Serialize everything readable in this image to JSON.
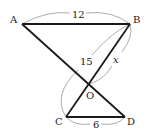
{
  "diagram": {
    "points": [
      {
        "name": "A",
        "x": 22,
        "y": 24,
        "label_x": 10,
        "label_y": 23
      },
      {
        "name": "B",
        "x": 130,
        "y": 24,
        "label_x": 133,
        "label_y": 23
      },
      {
        "name": "O",
        "x": 89,
        "y": 84,
        "label_x": 86,
        "label_y": 99
      },
      {
        "name": "C",
        "x": 66,
        "y": 117,
        "label_x": 55,
        "label_y": 125
      },
      {
        "name": "D",
        "x": 125,
        "y": 117,
        "label_x": 127,
        "label_y": 125
      }
    ],
    "segments": [
      {
        "from": "A",
        "to": "B"
      },
      {
        "from": "A",
        "to": "D"
      },
      {
        "from": "B",
        "to": "C"
      },
      {
        "from": "C",
        "to": "D"
      }
    ],
    "measurements": [
      {
        "segment": "AB",
        "value": "12",
        "label_x": 72,
        "label_y": 18
      },
      {
        "segment": "CB",
        "value": "15",
        "label_x": 80,
        "label_y": 65
      },
      {
        "segment": "OB",
        "value": "x",
        "label_x": 113,
        "label_y": 63,
        "italic": true
      },
      {
        "segment": "CD",
        "value": "6",
        "label_x": 93,
        "label_y": 128
      }
    ]
  }
}
